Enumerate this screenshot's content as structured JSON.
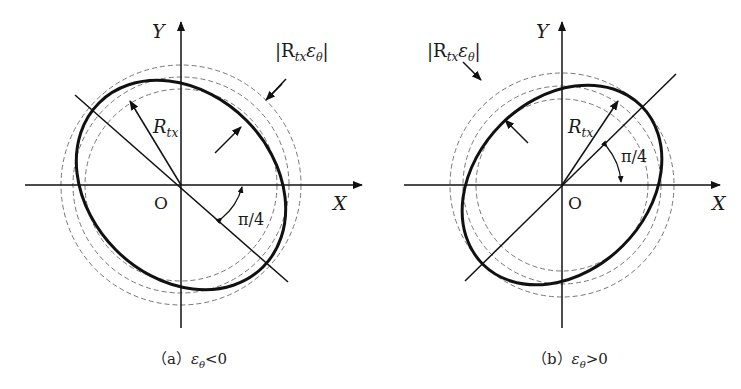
{
  "panels": [
    {
      "id": "a",
      "axis_x_label": "X",
      "axis_y_label": "Y",
      "origin_label": "O",
      "radius_label": "R",
      "radius_sub": "tx",
      "tolerance_label_main": "|R",
      "tolerance_label_sub1": "tx",
      "tolerance_label_eps": "ε",
      "tolerance_label_sub2": "θ",
      "tolerance_label_close": "|",
      "angle_label": "π/4",
      "caption_prefix": "（a）",
      "caption_eps": "ε",
      "caption_sub": "θ",
      "caption_rel": "<0"
    },
    {
      "id": "b",
      "axis_x_label": "X",
      "axis_y_label": "Y",
      "origin_label": "O",
      "radius_label": "R",
      "radius_sub": "tx",
      "tolerance_label_main": "|R",
      "tolerance_label_sub1": "tx",
      "tolerance_label_eps": "ε",
      "tolerance_label_sub2": "θ",
      "tolerance_label_close": "|",
      "angle_label": "π/4",
      "caption_prefix": "（b）",
      "caption_eps": "ε",
      "caption_sub": "θ",
      "caption_rel": ">0"
    }
  ],
  "colors": {
    "stroke": "#111111",
    "dashed": "#777777"
  }
}
